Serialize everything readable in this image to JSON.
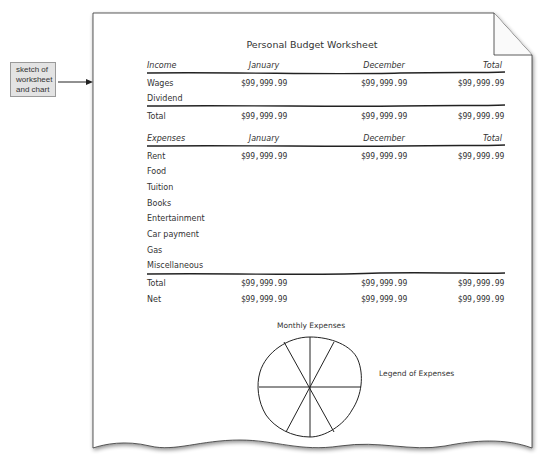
{
  "callout": {
    "lines": [
      "sketch of",
      "worksheet",
      "and chart"
    ]
  },
  "worksheet": {
    "title": "Personal Budget Worksheet",
    "income": {
      "headers": [
        "Income",
        "January",
        "December",
        "Total"
      ],
      "rows": [
        {
          "label": "Wages",
          "values": [
            "$99,999.99",
            "$99,999.99",
            "$99,999.99"
          ]
        },
        {
          "label": "Dividend",
          "values": [
            "",
            "",
            ""
          ]
        }
      ],
      "total": {
        "label": "Total",
        "values": [
          "$99,999.99",
          "$99,999.99",
          "$99,999.99"
        ]
      }
    },
    "expenses": {
      "headers": [
        "Expenses",
        "January",
        "December",
        "Total"
      ],
      "rows": [
        {
          "label": "Rent",
          "values": [
            "$99,999.99",
            "$99,999.99",
            "$99,999.99"
          ]
        },
        {
          "label": "Food",
          "values": [
            "",
            "",
            ""
          ]
        },
        {
          "label": "Tuition",
          "values": [
            "",
            "",
            ""
          ]
        },
        {
          "label": "Books",
          "values": [
            "",
            "",
            ""
          ]
        },
        {
          "label": "Entertainment",
          "values": [
            "",
            "",
            ""
          ]
        },
        {
          "label": "Car payment",
          "values": [
            "",
            "",
            ""
          ]
        },
        {
          "label": "Gas",
          "values": [
            "",
            "",
            ""
          ]
        },
        {
          "label": "Miscellaneous",
          "values": [
            "",
            "",
            ""
          ]
        }
      ],
      "total": {
        "label": "Total",
        "values": [
          "$99,999.99",
          "$99,999.99",
          "$99,999.99"
        ]
      },
      "net": {
        "label": "Net",
        "values": [
          "$99,999.99",
          "$99,999.99",
          "$99,999.99"
        ]
      }
    }
  },
  "chart": {
    "title": "Monthly Expenses",
    "legend_label": "Legend of Expenses",
    "slices": 8
  }
}
